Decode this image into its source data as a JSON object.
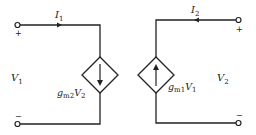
{
  "diagram": {
    "type": "two-port equivalent circuit",
    "colors": {
      "stroke": "#222222",
      "background": "#ffffff"
    },
    "left_port": {
      "current_label": {
        "main": "I",
        "sub": "1"
      },
      "voltage_label": {
        "main": "V",
        "sub": "1"
      },
      "plus_sign": "+",
      "minus_sign": "−",
      "source_label": {
        "g": "g",
        "g_sub": "m2",
        "v": "V",
        "v_sub": "2"
      },
      "source_arrow": "down"
    },
    "right_port": {
      "current_label": {
        "main": "I",
        "sub": "2"
      },
      "voltage_label": {
        "main": "V",
        "sub": "2"
      },
      "plus_sign": "+",
      "minus_sign": "−",
      "source_label": {
        "g": "g",
        "g_sub": "m1",
        "v": "V",
        "v_sub": "1"
      },
      "source_arrow": "up"
    }
  }
}
